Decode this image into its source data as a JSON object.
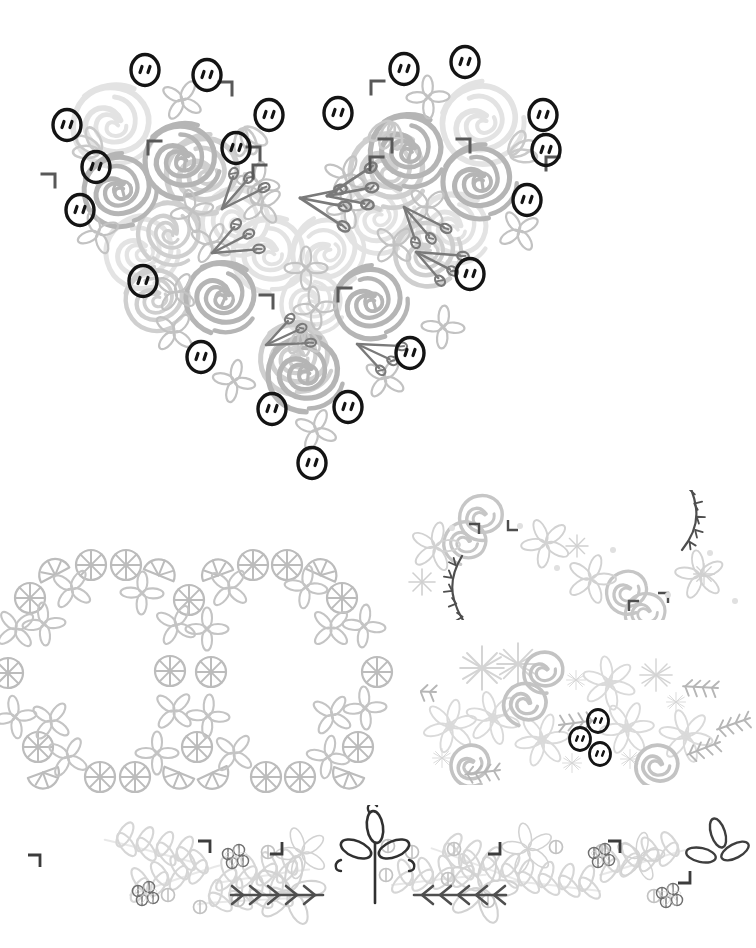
{
  "sheet": {
    "title": "Floral Doodle Clipart Sheet",
    "background": "#ffffff",
    "width": 751,
    "height": 948
  },
  "palette": {
    "button_black": "#141414",
    "rose_mid": "#b0b0b0",
    "rose_light": "#d8d8d8",
    "rose_pale": "#e6e6e6",
    "leaf_gray": "#bdbdbd",
    "leaf_light": "#d4d4d4",
    "pin_dark": "#6e6e6e",
    "vine_dark": "#4a4a4a",
    "citrus_gray": "#b8b8b8",
    "snow_pale": "#dcdcdc",
    "berry_gray": "#808080",
    "laurel_pale": "#d9d9d9"
  },
  "compositions": [
    {
      "id": "heart-bouquet",
      "name": "Floral Heart with Buttons",
      "shape": "heart",
      "elements": [
        "roses",
        "four-petal-flowers",
        "lavender-pins",
        "corner-ticks",
        "buttons"
      ],
      "button_count": 20,
      "rose_count": 26
    },
    {
      "id": "citrus-frame",
      "name": "Citrus Slice Rectangular Frame",
      "shape": "rectangle-border",
      "elements": [
        "citrus-slices",
        "citrus-wedges",
        "four-petal-flowers"
      ],
      "slice_count": 22,
      "wedge_count": 8
    },
    {
      "id": "rose-swirl-divider",
      "name": "Rose and Thorn Vine S-Divider",
      "shape": "s-curve",
      "elements": [
        "roses",
        "five-petal-flowers",
        "star-sparkles",
        "thorn-vines",
        "dots",
        "corner-ticks"
      ]
    },
    {
      "id": "winter-band",
      "name": "Snowflake and Poinsettia Band",
      "shape": "horizontal-band",
      "elements": [
        "snowflakes",
        "six-petal-flowers",
        "roses",
        "fir-twigs",
        "buttons"
      ],
      "button_count": 3
    },
    {
      "id": "laurel-border",
      "name": "Laurel Leaf Bottom Border",
      "shape": "horizontal-border",
      "elements": [
        "laurel-branches",
        "five-petal-flowers",
        "berry-clusters",
        "seed-circles",
        "fern-arrows",
        "corner-ticks",
        "dark-trefoil"
      ]
    }
  ]
}
